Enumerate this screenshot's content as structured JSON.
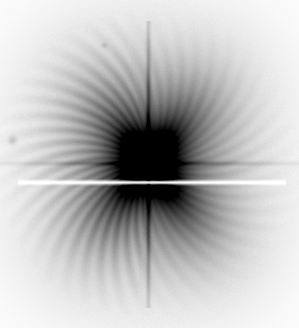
{
  "figure": {
    "width": 299,
    "height": 328,
    "background_color": "#ffffff",
    "title": "",
    "axis_visible": false,
    "colorbar_visible": false
  },
  "chart_data": {
    "type": "heatmap",
    "title": "",
    "subtitle": "",
    "xlabel": "",
    "ylabel": "",
    "colormap": "gray_r",
    "grid": false,
    "legend_position": "none",
    "xlim": [
      0,
      299
    ],
    "ylim": [
      0,
      328
    ],
    "value_range": [
      0.0,
      1.0
    ],
    "background_value": 0.0,
    "center": {
      "x": 148,
      "y": 163
    },
    "halo": {
      "name": "diffuse-halo",
      "shape": "circular",
      "radius_x": 118,
      "radius_y": 128,
      "peak_value": 0.46,
      "falloff": "gaussian",
      "bbox": {
        "left": 30,
        "top": 36,
        "right": 268,
        "bottom": 292
      }
    },
    "core": {
      "name": "dark-core",
      "radius": 22,
      "peak_value": 0.82,
      "value_at_center": 0.8
    },
    "cross_lobes": {
      "name": "x-shaped-diffraction-spikes",
      "count": 4,
      "angles_deg": [
        52,
        128,
        232,
        308
      ],
      "length": 95,
      "width": 46,
      "peak_value": 0.62,
      "lobes": [
        {
          "label": "upper-left",
          "angle_deg": 128,
          "strength": 0.58
        },
        {
          "label": "upper-right",
          "angle_deg": 52,
          "strength": 0.66
        },
        {
          "label": "lower-left",
          "angle_deg": 232,
          "strength": 0.44
        },
        {
          "label": "lower-right",
          "angle_deg": 308,
          "strength": 0.5
        }
      ]
    },
    "vertical_streak": {
      "name": "vertical-dark-streak",
      "x": 148,
      "top": 60,
      "bottom": 268,
      "width": 3,
      "peak_value": 0.88
    },
    "horizontal_streak": {
      "name": "horizontal-dark-streak",
      "y": 163,
      "left": 52,
      "right": 250,
      "height": 3,
      "peak_value": 0.52
    },
    "bright_line": {
      "name": "bright-horizontal-scan-line",
      "y": 182,
      "x_start": 18,
      "x_end": 285,
      "thickness": 1.6,
      "value": -0.35,
      "color": "#ffffff"
    },
    "radial_spokes": {
      "name": "radial-spoke-streaks",
      "count": 44,
      "inner_radius": 26,
      "outer_radius": 122,
      "amplitude": 0.055,
      "twist_deg": 26,
      "dominant_sector_deg": [
        95,
        260
      ]
    },
    "specks": [
      {
        "name": "speck-left",
        "x": 12,
        "y": 140,
        "radius": 3.0,
        "value": 0.14
      },
      {
        "name": "speck-upper",
        "x": 104,
        "y": 45,
        "radius": 2.0,
        "value": 0.1
      }
    ],
    "noise": {
      "amplitude": 0.02,
      "grain_size": 1
    }
  }
}
